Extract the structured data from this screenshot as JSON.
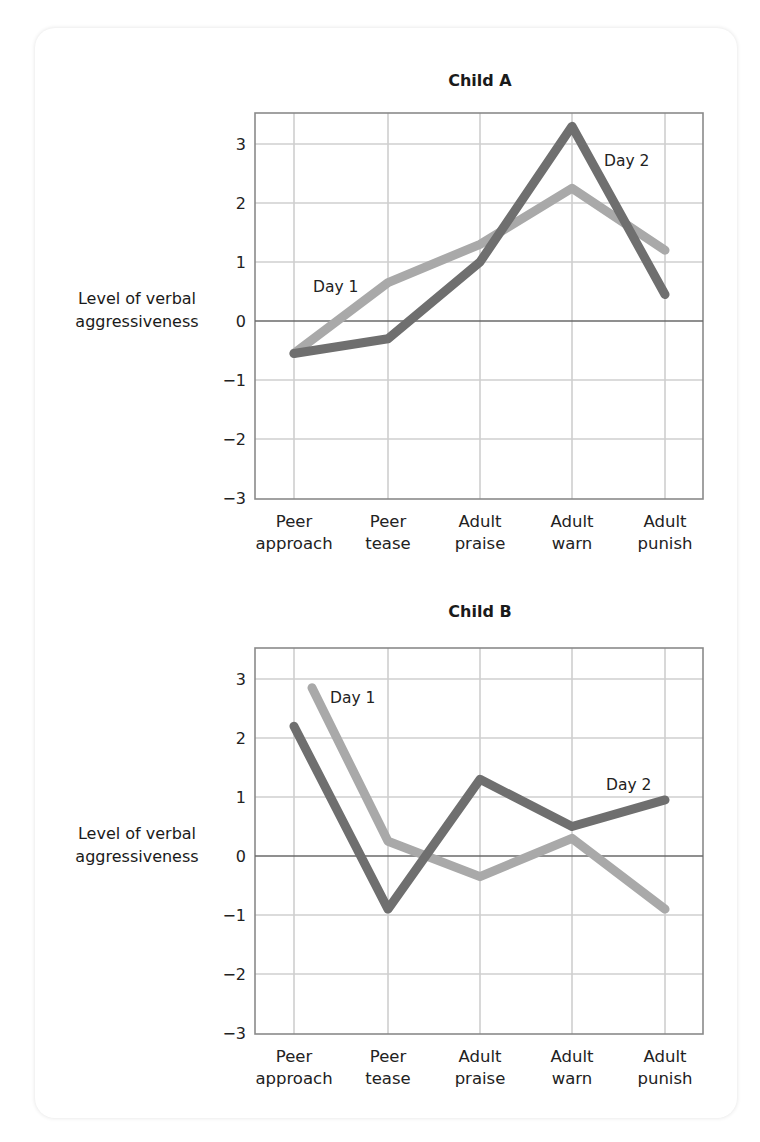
{
  "chart_data": [
    {
      "type": "line",
      "title": "Child A",
      "xlabel": "",
      "ylabel": "Level of verbal aggressiveness",
      "categories": [
        "Peer approach",
        "Peer tease",
        "Adult praise",
        "Adult warn",
        "Adult punish"
      ],
      "ylim": [
        -3,
        3.5
      ],
      "yticks": [
        3,
        2,
        1,
        0,
        -1,
        -2,
        -3
      ],
      "grid": true,
      "series": [
        {
          "name": "Day 1",
          "color": "#a9a9a9",
          "values": [
            -0.55,
            0.65,
            1.3,
            2.25,
            1.2
          ]
        },
        {
          "name": "Day 2",
          "color": "#6f6f6f",
          "values": [
            -0.55,
            -0.3,
            1.0,
            3.3,
            0.45
          ]
        }
      ],
      "annotations": [
        "Day 1",
        "Day 2"
      ]
    },
    {
      "type": "line",
      "title": "Child B",
      "xlabel": "",
      "ylabel": "Level of verbal aggressiveness",
      "categories": [
        "Peer approach",
        "Peer tease",
        "Adult praise",
        "Adult warn",
        "Adult punish"
      ],
      "ylim": [
        -3,
        3.5
      ],
      "yticks": [
        3,
        2,
        1,
        0,
        -1,
        -2,
        -3
      ],
      "grid": true,
      "series": [
        {
          "name": "Day 1",
          "color": "#a9a9a9",
          "values": [
            2.85,
            0.25,
            -0.35,
            0.3,
            -0.9
          ]
        },
        {
          "name": "Day 2",
          "color": "#6f6f6f",
          "values": [
            2.2,
            -0.9,
            1.3,
            0.5,
            0.95
          ]
        }
      ],
      "annotations": [
        "Day 1",
        "Day 2"
      ]
    }
  ],
  "labels": {
    "chartA_title": "Child A",
    "chartB_title": "Child B",
    "ylabel_line1": "Level of verbal",
    "ylabel_line2": "aggressiveness",
    "day1": "Day 1",
    "day2": "Day 2",
    "yticks": [
      "3",
      "2",
      "1",
      "0",
      "−1",
      "−2",
      "−3"
    ],
    "cat_line1": [
      "Peer",
      "Peer",
      "Adult",
      "Adult",
      "Adult"
    ],
    "cat_line2": [
      "approach",
      "tease",
      "praise",
      "warn",
      "punish"
    ]
  }
}
